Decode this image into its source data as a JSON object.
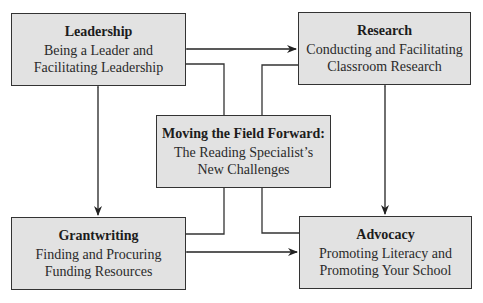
{
  "diagram": {
    "center": {
      "title": "Moving the Field Forward:",
      "line1": "The Reading Specialist’s",
      "line2": "New Challenges"
    },
    "nodes": [
      {
        "id": "leadership",
        "title": "Leadership",
        "line1": "Being a Leader and",
        "line2": "Facilitating Leadership"
      },
      {
        "id": "research",
        "title": "Research",
        "line1": "Conducting and Facilitating",
        "line2": "Classroom Research"
      },
      {
        "id": "grantwriting",
        "title": "Grantwriting",
        "line1": "Finding and Procuring",
        "line2": "Funding Resources"
      },
      {
        "id": "advocacy",
        "title": "Advocacy",
        "line1": "Promoting Literacy and",
        "line2": "Promoting Your School"
      }
    ],
    "edges": [
      {
        "from": "leadership",
        "to": "research",
        "type": "bidirectional-arrow"
      },
      {
        "from": "grantwriting",
        "to": "advocacy",
        "type": "bidirectional-arrow"
      },
      {
        "from": "leadership",
        "to": "grantwriting",
        "type": "bidirectional-arrow"
      },
      {
        "from": "research",
        "to": "advocacy",
        "type": "bidirectional-arrow"
      },
      {
        "from": "center",
        "to": "leadership",
        "type": "line"
      },
      {
        "from": "center",
        "to": "research",
        "type": "line"
      },
      {
        "from": "center",
        "to": "grantwriting",
        "type": "line"
      },
      {
        "from": "center",
        "to": "advocacy",
        "type": "line"
      }
    ],
    "colors": {
      "box_fill": "#e2e2e2",
      "border": "#333333",
      "text": "#1c1c1c"
    }
  }
}
